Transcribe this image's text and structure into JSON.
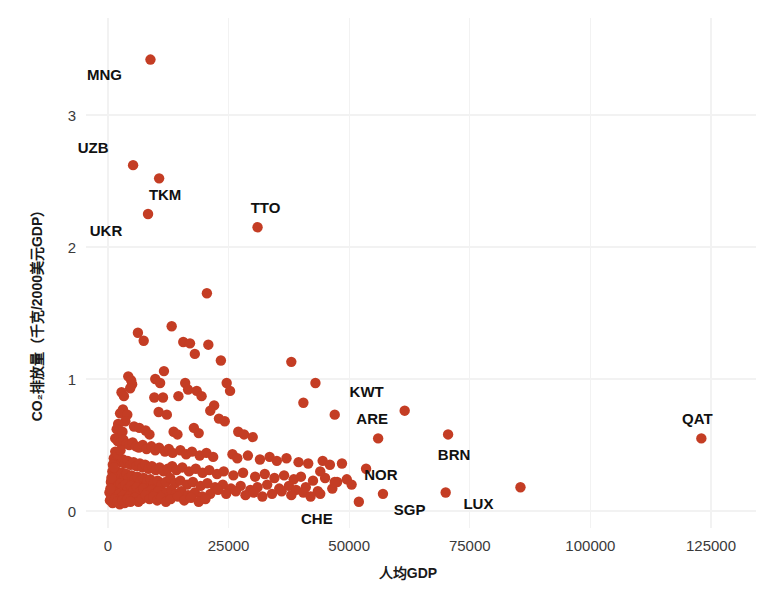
{
  "chart_data": {
    "type": "scatter",
    "title": "",
    "xlabel": "人均GDP",
    "ylabel": "CO₂排放量（千克/2000美元GDP）",
    "xlim": [
      -4000,
      134000
    ],
    "ylim": [
      -0.18,
      3.62
    ],
    "xticks": [
      0,
      25000,
      50000,
      75000,
      100000,
      125000
    ],
    "xticklabels": [
      "0",
      "25000",
      "50000",
      "75000",
      "100000",
      "125000"
    ],
    "yticks": [
      0,
      1,
      2,
      3
    ],
    "yticklabels": [
      "0",
      "1",
      "2",
      "3"
    ],
    "grid": true,
    "legend": false,
    "marker_color": "#c43d24",
    "marker_size": 5.2,
    "background": "#ffffff",
    "gridline_color": "#f2f2f2",
    "annotations": [
      {
        "label": "MNG",
        "x": 8800,
        "y": 3.42,
        "dx": -46,
        "dy": 20
      },
      {
        "label": "UZB",
        "x": 5200,
        "y": 2.62,
        "dx": -40,
        "dy": -12
      },
      {
        "label": "TKM",
        "x": 10600,
        "y": 2.52,
        "dx": 6,
        "dy": 22
      },
      {
        "label": "UKR",
        "x": 8300,
        "y": 2.25,
        "dx": -42,
        "dy": 22
      },
      {
        "label": "TTO",
        "x": 31000,
        "y": 2.15,
        "dx": 8,
        "dy": -14
      },
      {
        "label": "KWT",
        "x": 61500,
        "y": 0.76,
        "dx": -38,
        "dy": -14
      },
      {
        "label": "ARE",
        "x": 56000,
        "y": 0.55,
        "dx": -6,
        "dy": -14
      },
      {
        "label": "BRN",
        "x": 70500,
        "y": 0.58,
        "dx": 6,
        "dy": 26
      },
      {
        "label": "NOR",
        "x": 57000,
        "y": 0.13,
        "dx": -2,
        "dy": -14
      },
      {
        "label": "CHE",
        "x": 52000,
        "y": 0.07,
        "dx": -42,
        "dy": 22
      },
      {
        "label": "SGP",
        "x": 70000,
        "y": 0.14,
        "dx": -36,
        "dy": 22
      },
      {
        "label": "LUX",
        "x": 85500,
        "y": 0.18,
        "dx": -42,
        "dy": 22
      },
      {
        "label": "QAT",
        "x": 123000,
        "y": 0.55,
        "dx": -4,
        "dy": -14
      }
    ],
    "points": [
      {
        "x": 8800,
        "y": 3.42
      },
      {
        "x": 5200,
        "y": 2.62
      },
      {
        "x": 10600,
        "y": 2.52
      },
      {
        "x": 8300,
        "y": 2.25
      },
      {
        "x": 31000,
        "y": 2.15
      },
      {
        "x": 20500,
        "y": 1.65
      },
      {
        "x": 6200,
        "y": 1.35
      },
      {
        "x": 7400,
        "y": 1.29
      },
      {
        "x": 13200,
        "y": 1.4
      },
      {
        "x": 15600,
        "y": 1.28
      },
      {
        "x": 17000,
        "y": 1.27
      },
      {
        "x": 20800,
        "y": 1.26
      },
      {
        "x": 18000,
        "y": 1.19
      },
      {
        "x": 23400,
        "y": 1.14
      },
      {
        "x": 38000,
        "y": 1.13
      },
      {
        "x": 11600,
        "y": 1.06
      },
      {
        "x": 4200,
        "y": 1.02
      },
      {
        "x": 4800,
        "y": 0.99
      },
      {
        "x": 5000,
        "y": 0.96
      },
      {
        "x": 4600,
        "y": 0.93
      },
      {
        "x": 9800,
        "y": 1.0
      },
      {
        "x": 10800,
        "y": 0.97
      },
      {
        "x": 2800,
        "y": 0.9
      },
      {
        "x": 3300,
        "y": 0.87
      },
      {
        "x": 9600,
        "y": 0.86
      },
      {
        "x": 11400,
        "y": 0.86
      },
      {
        "x": 16000,
        "y": 0.97
      },
      {
        "x": 16600,
        "y": 0.92
      },
      {
        "x": 14600,
        "y": 0.87
      },
      {
        "x": 18400,
        "y": 0.91
      },
      {
        "x": 19400,
        "y": 0.87
      },
      {
        "x": 24600,
        "y": 0.97
      },
      {
        "x": 25300,
        "y": 0.91
      },
      {
        "x": 43000,
        "y": 0.97
      },
      {
        "x": 40500,
        "y": 0.82
      },
      {
        "x": 22000,
        "y": 0.8
      },
      {
        "x": 3100,
        "y": 0.77
      },
      {
        "x": 2500,
        "y": 0.74
      },
      {
        "x": 4000,
        "y": 0.73
      },
      {
        "x": 10500,
        "y": 0.75
      },
      {
        "x": 12200,
        "y": 0.73
      },
      {
        "x": 21200,
        "y": 0.76
      },
      {
        "x": 23000,
        "y": 0.7
      },
      {
        "x": 24200,
        "y": 0.68
      },
      {
        "x": 47000,
        "y": 0.73
      },
      {
        "x": 3600,
        "y": 0.68
      },
      {
        "x": 2100,
        "y": 0.66
      },
      {
        "x": 5400,
        "y": 0.64
      },
      {
        "x": 6500,
        "y": 0.63
      },
      {
        "x": 1800,
        "y": 0.62
      },
      {
        "x": 2400,
        "y": 0.61
      },
      {
        "x": 3000,
        "y": 0.6
      },
      {
        "x": 7800,
        "y": 0.61
      },
      {
        "x": 8600,
        "y": 0.58
      },
      {
        "x": 13600,
        "y": 0.6
      },
      {
        "x": 14400,
        "y": 0.58
      },
      {
        "x": 17800,
        "y": 0.63
      },
      {
        "x": 18800,
        "y": 0.59
      },
      {
        "x": 27000,
        "y": 0.6
      },
      {
        "x": 28200,
        "y": 0.58
      },
      {
        "x": 30000,
        "y": 0.56
      },
      {
        "x": 56000,
        "y": 0.55
      },
      {
        "x": 61500,
        "y": 0.76
      },
      {
        "x": 70500,
        "y": 0.58
      },
      {
        "x": 123000,
        "y": 0.55
      },
      {
        "x": 1500,
        "y": 0.55
      },
      {
        "x": 2000,
        "y": 0.53
      },
      {
        "x": 2600,
        "y": 0.52
      },
      {
        "x": 3200,
        "y": 0.54
      },
      {
        "x": 3900,
        "y": 0.51
      },
      {
        "x": 4400,
        "y": 0.5
      },
      {
        "x": 5100,
        "y": 0.52
      },
      {
        "x": 5800,
        "y": 0.49
      },
      {
        "x": 6400,
        "y": 0.48
      },
      {
        "x": 7200,
        "y": 0.5
      },
      {
        "x": 8000,
        "y": 0.47
      },
      {
        "x": 9000,
        "y": 0.49
      },
      {
        "x": 9800,
        "y": 0.46
      },
      {
        "x": 10600,
        "y": 0.48
      },
      {
        "x": 11800,
        "y": 0.45
      },
      {
        "x": 12600,
        "y": 0.47
      },
      {
        "x": 13400,
        "y": 0.44
      },
      {
        "x": 15000,
        "y": 0.46
      },
      {
        "x": 16200,
        "y": 0.43
      },
      {
        "x": 17400,
        "y": 0.45
      },
      {
        "x": 19000,
        "y": 0.42
      },
      {
        "x": 20400,
        "y": 0.44
      },
      {
        "x": 21800,
        "y": 0.41
      },
      {
        "x": 25800,
        "y": 0.43
      },
      {
        "x": 26800,
        "y": 0.4
      },
      {
        "x": 29000,
        "y": 0.42
      },
      {
        "x": 31500,
        "y": 0.39
      },
      {
        "x": 33500,
        "y": 0.41
      },
      {
        "x": 35000,
        "y": 0.38
      },
      {
        "x": 37000,
        "y": 0.4
      },
      {
        "x": 39500,
        "y": 0.37
      },
      {
        "x": 41500,
        "y": 0.36
      },
      {
        "x": 44500,
        "y": 0.38
      },
      {
        "x": 46000,
        "y": 0.35
      },
      {
        "x": 48500,
        "y": 0.36
      },
      {
        "x": 1200,
        "y": 0.4
      },
      {
        "x": 1700,
        "y": 0.38
      },
      {
        "x": 2200,
        "y": 0.4
      },
      {
        "x": 2700,
        "y": 0.37
      },
      {
        "x": 3100,
        "y": 0.39
      },
      {
        "x": 3500,
        "y": 0.36
      },
      {
        "x": 4100,
        "y": 0.38
      },
      {
        "x": 4700,
        "y": 0.35
      },
      {
        "x": 5300,
        "y": 0.37
      },
      {
        "x": 5900,
        "y": 0.34
      },
      {
        "x": 6600,
        "y": 0.36
      },
      {
        "x": 7100,
        "y": 0.33
      },
      {
        "x": 7700,
        "y": 0.35
      },
      {
        "x": 8400,
        "y": 0.32
      },
      {
        "x": 9100,
        "y": 0.34
      },
      {
        "x": 9900,
        "y": 0.31
      },
      {
        "x": 10700,
        "y": 0.33
      },
      {
        "x": 11500,
        "y": 0.3
      },
      {
        "x": 12400,
        "y": 0.32
      },
      {
        "x": 13300,
        "y": 0.34
      },
      {
        "x": 14200,
        "y": 0.31
      },
      {
        "x": 15400,
        "y": 0.33
      },
      {
        "x": 16800,
        "y": 0.3
      },
      {
        "x": 18200,
        "y": 0.32
      },
      {
        "x": 19600,
        "y": 0.29
      },
      {
        "x": 21000,
        "y": 0.31
      },
      {
        "x": 22600,
        "y": 0.28
      },
      {
        "x": 24000,
        "y": 0.3
      },
      {
        "x": 26000,
        "y": 0.27
      },
      {
        "x": 28000,
        "y": 0.29
      },
      {
        "x": 30500,
        "y": 0.26
      },
      {
        "x": 32500,
        "y": 0.28
      },
      {
        "x": 34500,
        "y": 0.25
      },
      {
        "x": 36500,
        "y": 0.27
      },
      {
        "x": 38500,
        "y": 0.24
      },
      {
        "x": 40000,
        "y": 0.26
      },
      {
        "x": 42500,
        "y": 0.23
      },
      {
        "x": 45000,
        "y": 0.25
      },
      {
        "x": 47500,
        "y": 0.22
      },
      {
        "x": 49500,
        "y": 0.24
      },
      {
        "x": 900,
        "y": 0.3
      },
      {
        "x": 1400,
        "y": 0.28
      },
      {
        "x": 1900,
        "y": 0.3
      },
      {
        "x": 2300,
        "y": 0.27
      },
      {
        "x": 2900,
        "y": 0.29
      },
      {
        "x": 3400,
        "y": 0.26
      },
      {
        "x": 3800,
        "y": 0.28
      },
      {
        "x": 4300,
        "y": 0.25
      },
      {
        "x": 4900,
        "y": 0.27
      },
      {
        "x": 5500,
        "y": 0.24
      },
      {
        "x": 6100,
        "y": 0.26
      },
      {
        "x": 6800,
        "y": 0.23
      },
      {
        "x": 7400,
        "y": 0.25
      },
      {
        "x": 8100,
        "y": 0.22
      },
      {
        "x": 8800,
        "y": 0.24
      },
      {
        "x": 9500,
        "y": 0.21
      },
      {
        "x": 10300,
        "y": 0.23
      },
      {
        "x": 11100,
        "y": 0.2
      },
      {
        "x": 12000,
        "y": 0.22
      },
      {
        "x": 12900,
        "y": 0.25
      },
      {
        "x": 13900,
        "y": 0.21
      },
      {
        "x": 15000,
        "y": 0.23
      },
      {
        "x": 16400,
        "y": 0.2
      },
      {
        "x": 17600,
        "y": 0.22
      },
      {
        "x": 19200,
        "y": 0.19
      },
      {
        "x": 20600,
        "y": 0.21
      },
      {
        "x": 22200,
        "y": 0.18
      },
      {
        "x": 23800,
        "y": 0.2
      },
      {
        "x": 25500,
        "y": 0.17
      },
      {
        "x": 27500,
        "y": 0.19
      },
      {
        "x": 29500,
        "y": 0.16
      },
      {
        "x": 31000,
        "y": 0.18
      },
      {
        "x": 33000,
        "y": 0.2
      },
      {
        "x": 35500,
        "y": 0.17
      },
      {
        "x": 37500,
        "y": 0.19
      },
      {
        "x": 39000,
        "y": 0.16
      },
      {
        "x": 41000,
        "y": 0.18
      },
      {
        "x": 43500,
        "y": 0.15
      },
      {
        "x": 46500,
        "y": 0.17
      },
      {
        "x": 600,
        "y": 0.22
      },
      {
        "x": 1100,
        "y": 0.2
      },
      {
        "x": 1600,
        "y": 0.22
      },
      {
        "x": 2050,
        "y": 0.19
      },
      {
        "x": 2550,
        "y": 0.21
      },
      {
        "x": 3050,
        "y": 0.18
      },
      {
        "x": 3600,
        "y": 0.2
      },
      {
        "x": 4150,
        "y": 0.17
      },
      {
        "x": 4750,
        "y": 0.19
      },
      {
        "x": 5350,
        "y": 0.16
      },
      {
        "x": 6000,
        "y": 0.18
      },
      {
        "x": 6700,
        "y": 0.15
      },
      {
        "x": 7300,
        "y": 0.17
      },
      {
        "x": 8200,
        "y": 0.14
      },
      {
        "x": 9000,
        "y": 0.16
      },
      {
        "x": 9700,
        "y": 0.13
      },
      {
        "x": 10400,
        "y": 0.15
      },
      {
        "x": 11300,
        "y": 0.12
      },
      {
        "x": 12200,
        "y": 0.14
      },
      {
        "x": 13100,
        "y": 0.16
      },
      {
        "x": 14100,
        "y": 0.13
      },
      {
        "x": 15200,
        "y": 0.15
      },
      {
        "x": 16600,
        "y": 0.12
      },
      {
        "x": 18000,
        "y": 0.14
      },
      {
        "x": 19500,
        "y": 0.11
      },
      {
        "x": 21200,
        "y": 0.13
      },
      {
        "x": 22800,
        "y": 0.16
      },
      {
        "x": 24500,
        "y": 0.13
      },
      {
        "x": 26500,
        "y": 0.15
      },
      {
        "x": 28500,
        "y": 0.12
      },
      {
        "x": 30200,
        "y": 0.14
      },
      {
        "x": 32000,
        "y": 0.11
      },
      {
        "x": 34000,
        "y": 0.13
      },
      {
        "x": 36000,
        "y": 0.15
      },
      {
        "x": 38000,
        "y": 0.12
      },
      {
        "x": 40500,
        "y": 0.14
      },
      {
        "x": 42000,
        "y": 0.11
      },
      {
        "x": 44000,
        "y": 0.13
      },
      {
        "x": 300,
        "y": 0.14
      },
      {
        "x": 800,
        "y": 0.12
      },
      {
        "x": 1300,
        "y": 0.14
      },
      {
        "x": 1750,
        "y": 0.11
      },
      {
        "x": 2250,
        "y": 0.13
      },
      {
        "x": 2750,
        "y": 0.1
      },
      {
        "x": 3250,
        "y": 0.12
      },
      {
        "x": 3750,
        "y": 0.09
      },
      {
        "x": 4350,
        "y": 0.11
      },
      {
        "x": 4950,
        "y": 0.08
      },
      {
        "x": 5600,
        "y": 0.1
      },
      {
        "x": 6300,
        "y": 0.07
      },
      {
        "x": 7000,
        "y": 0.09
      },
      {
        "x": 7800,
        "y": 0.12
      },
      {
        "x": 8600,
        "y": 0.09
      },
      {
        "x": 9400,
        "y": 0.11
      },
      {
        "x": 10200,
        "y": 0.08
      },
      {
        "x": 11000,
        "y": 0.1
      },
      {
        "x": 12000,
        "y": 0.07
      },
      {
        "x": 13000,
        "y": 0.09
      },
      {
        "x": 14500,
        "y": 0.11
      },
      {
        "x": 15800,
        "y": 0.08
      },
      {
        "x": 17200,
        "y": 0.1
      },
      {
        "x": 18800,
        "y": 0.07
      },
      {
        "x": 20200,
        "y": 0.09
      },
      {
        "x": 400,
        "y": 0.08
      },
      {
        "x": 950,
        "y": 0.06
      },
      {
        "x": 1450,
        "y": 0.09
      },
      {
        "x": 1950,
        "y": 0.07
      },
      {
        "x": 2450,
        "y": 0.05
      },
      {
        "x": 2950,
        "y": 0.08
      },
      {
        "x": 3450,
        "y": 0.06
      },
      {
        "x": 4050,
        "y": 0.09
      },
      {
        "x": 4650,
        "y": 0.07
      },
      {
        "x": 500,
        "y": 0.17
      },
      {
        "x": 1000,
        "y": 0.35
      },
      {
        "x": 1500,
        "y": 0.45
      },
      {
        "x": 2000,
        "y": 0.43
      },
      {
        "x": 2600,
        "y": 0.46
      },
      {
        "x": 700,
        "y": 0.25
      },
      {
        "x": 1200,
        "y": 0.33
      },
      {
        "x": 52000,
        "y": 0.07
      },
      {
        "x": 57000,
        "y": 0.13
      },
      {
        "x": 70000,
        "y": 0.14
      },
      {
        "x": 85500,
        "y": 0.18
      },
      {
        "x": 50500,
        "y": 0.2
      },
      {
        "x": 53500,
        "y": 0.32
      },
      {
        "x": 47000,
        "y": 0.22
      },
      {
        "x": 44000,
        "y": 0.3
      }
    ]
  },
  "axes": {
    "x_tick_labels": [
      "0",
      "25000",
      "50000",
      "75000",
      "100000",
      "125000"
    ],
    "y_tick_labels": [
      "0",
      "1",
      "2",
      "3"
    ],
    "x_title": "人均GDP",
    "y_title": "CO₂排放量（千克/2000美元GDP）"
  }
}
